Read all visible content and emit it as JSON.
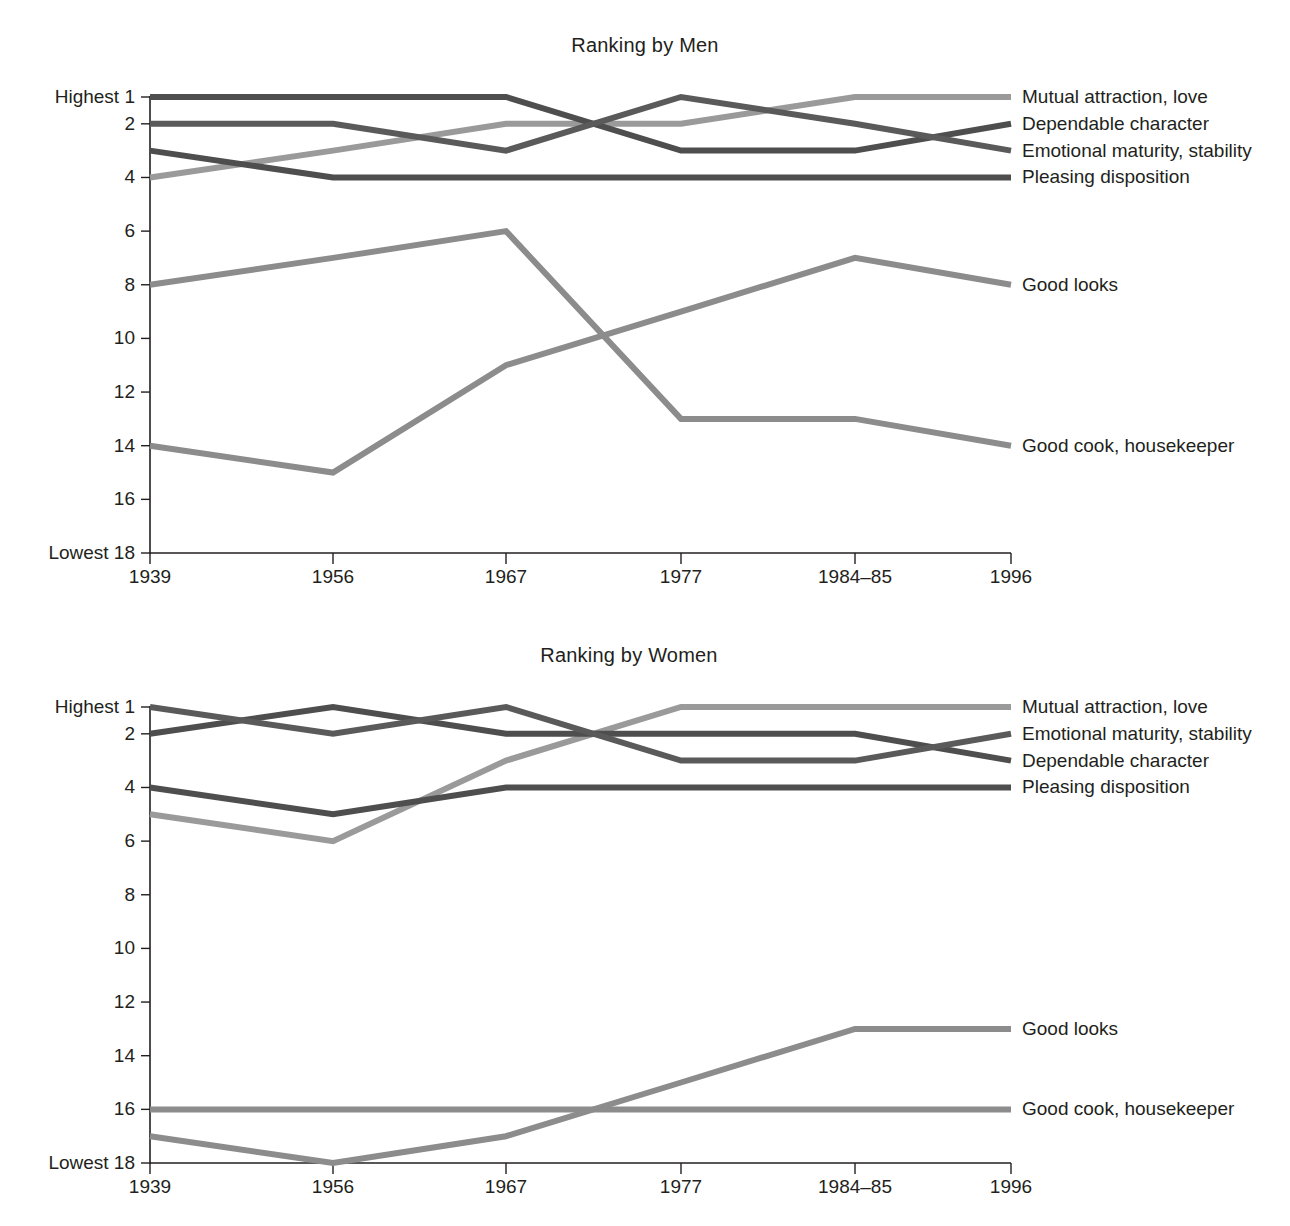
{
  "chart_data": [
    {
      "type": "line",
      "title": "Ranking by Men",
      "xlabel": "",
      "ylabel": "",
      "categories": [
        "1939",
        "1956",
        "1967",
        "1977",
        "1984–85",
        "1996"
      ],
      "ylim": [
        1,
        18
      ],
      "y_ticks": [
        1,
        2,
        4,
        6,
        8,
        10,
        12,
        14,
        16,
        18
      ],
      "y_tick_labels": [
        "Highest 1",
        "2",
        "4",
        "6",
        "8",
        "10",
        "12",
        "14",
        "16",
        "Lowest 18"
      ],
      "y_axis_inverted": true,
      "grid": false,
      "legend": "right-inline",
      "series": [
        {
          "name": "Mutual attraction, love",
          "values": [
            4,
            3,
            2,
            2,
            1,
            1
          ],
          "color": "#9a9a9a"
        },
        {
          "name": "Dependable character",
          "values": [
            1,
            1,
            1,
            3,
            3,
            2
          ],
          "color": "#4e4e4e"
        },
        {
          "name": "Emotional maturity, stability",
          "values": [
            2,
            2,
            3,
            1,
            2,
            3
          ],
          "color": "#5a5a5a"
        },
        {
          "name": "Pleasing disposition",
          "values": [
            3,
            4,
            4,
            4,
            4,
            4
          ],
          "color": "#4e4e4e"
        },
        {
          "name": "Good looks",
          "values": [
            14,
            15,
            11,
            9,
            7,
            8
          ],
          "color": "#8c8c8c"
        },
        {
          "name": "Good cook, housekeeper",
          "values": [
            8,
            7,
            6,
            13,
            13,
            14
          ],
          "color": "#8c8c8c"
        }
      ]
    },
    {
      "type": "line",
      "title": "Ranking by Women",
      "xlabel": "",
      "ylabel": "",
      "categories": [
        "1939",
        "1956",
        "1967",
        "1977",
        "1984–85",
        "1996"
      ],
      "ylim": [
        1,
        18
      ],
      "y_ticks": [
        1,
        2,
        4,
        6,
        8,
        10,
        12,
        14,
        16,
        18
      ],
      "y_tick_labels": [
        "Highest 1",
        "2",
        "4",
        "6",
        "8",
        "10",
        "12",
        "14",
        "16",
        "Lowest 18"
      ],
      "y_axis_inverted": true,
      "grid": false,
      "legend": "right-inline",
      "series": [
        {
          "name": "Mutual attraction, love",
          "values": [
            5,
            6,
            3,
            1,
            1,
            1
          ],
          "color": "#9a9a9a"
        },
        {
          "name": "Dependable character",
          "values": [
            2,
            1,
            2,
            2,
            2,
            3
          ],
          "color": "#4e4e4e"
        },
        {
          "name": "Emotional maturity, stability",
          "values": [
            1,
            2,
            1,
            3,
            3,
            2
          ],
          "color": "#5a5a5a"
        },
        {
          "name": "Pleasing disposition",
          "values": [
            4,
            5,
            4,
            4,
            4,
            4
          ],
          "color": "#4e4e4e"
        },
        {
          "name": "Good looks",
          "values": [
            17,
            18,
            17,
            15,
            13,
            13
          ],
          "color": "#8c8c8c"
        },
        {
          "name": "Good cook, housekeeper",
          "values": [
            16,
            16,
            16,
            16,
            16,
            16
          ],
          "color": "#8c8c8c"
        }
      ]
    }
  ]
}
